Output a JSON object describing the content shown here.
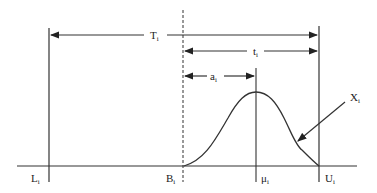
{
  "diagram": {
    "type": "timing-distribution",
    "labels": {
      "T": {
        "main": "T",
        "sub": "i"
      },
      "t": {
        "main": "t",
        "sub": "i"
      },
      "a": {
        "main": "a",
        "sub": "i"
      },
      "X": {
        "main": "X",
        "sub": "i"
      },
      "L": {
        "main": "L",
        "sub": "i"
      },
      "B": {
        "main": "B",
        "sub": "i"
      },
      "mu": {
        "main": "μ",
        "sub": "i"
      },
      "U": {
        "main": "U",
        "sub": "i"
      }
    },
    "colors": {
      "line": "#333333",
      "background": "#ffffff"
    }
  }
}
